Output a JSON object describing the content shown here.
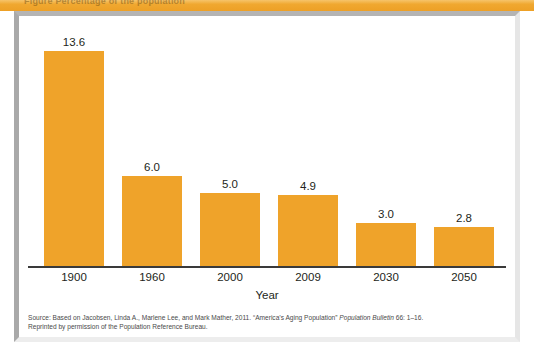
{
  "header_band": {
    "cut_off_title": "Figure   Percentage of the population",
    "color": "#F0A830"
  },
  "figure": {
    "frame_color": "#A9A9A9",
    "background": "#FFFFFF"
  },
  "axis": {
    "x_title": "Year",
    "baseline_color": "#3A3A3A"
  },
  "source": {
    "line1_a": "Source: Based on Jacobsen, Linda A., Marlene Lee, and Mark Mather, 2011. “America’s Aging Population” ",
    "line1_italic": "Population Bulletin",
    "line1_b": " 66: 1–16.",
    "line2": "Reprinted by permission of the Population Reference Bureau."
  },
  "chart_data": {
    "type": "bar",
    "title": "",
    "xlabel": "Year",
    "ylabel": "",
    "categories": [
      "1900",
      "1960",
      "2000",
      "2009",
      "2030",
      "2050"
    ],
    "values": [
      13.6,
      6.0,
      5.0,
      4.9,
      3.0,
      2.8
    ],
    "value_labels": [
      "13.6",
      "6.0",
      "5.0",
      "4.9",
      "3.0",
      "2.8"
    ],
    "bar_pixel_heights": [
      215,
      90,
      73,
      71,
      43,
      39
    ],
    "series": [
      {
        "name": "Percentage",
        "values": [
          13.6,
          6.0,
          5.0,
          4.9,
          3.0,
          2.8
        ]
      }
    ],
    "bar_color": "#EFA32A",
    "grid": false,
    "legend": "none",
    "axis_visible": {
      "x": true,
      "y": false
    }
  }
}
